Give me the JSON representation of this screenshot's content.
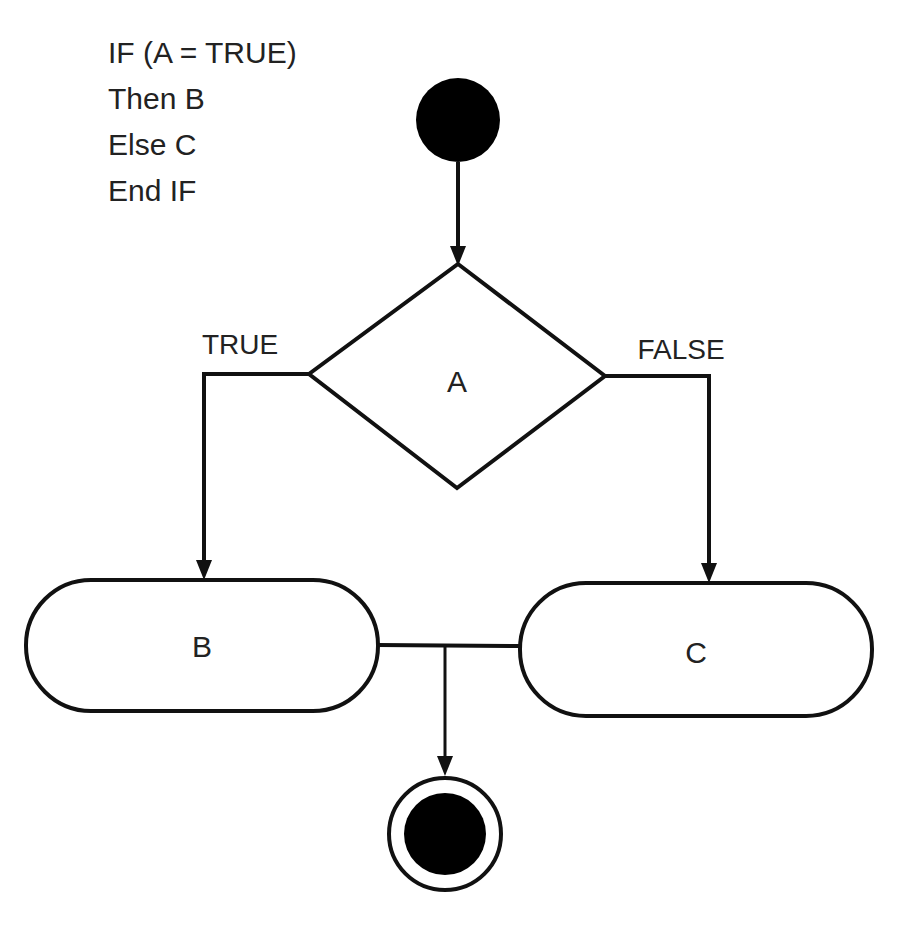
{
  "pseudocode": {
    "lines": [
      "IF (A = TRUE)",
      "Then B",
      "Else C",
      "End IF"
    ]
  },
  "diagram": {
    "decision": {
      "label": "A"
    },
    "branches": {
      "true_label": "TRUE",
      "false_label": "FALSE"
    },
    "actions": [
      {
        "id": "B",
        "label": "B"
      },
      {
        "id": "C",
        "label": "C"
      }
    ],
    "start_node": "initial-node",
    "end_node": "final-node",
    "stroke_color": "#111111",
    "fill_color": "#000000"
  }
}
